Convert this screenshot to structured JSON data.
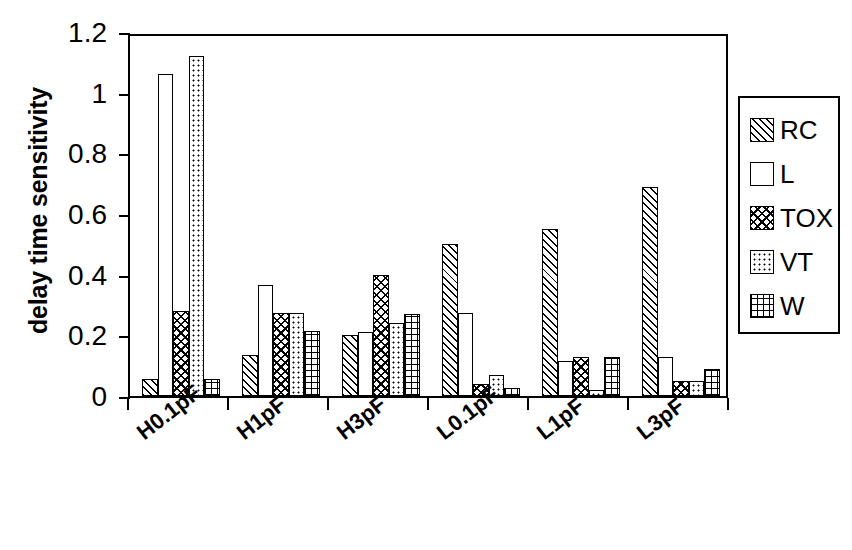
{
  "chart_data": {
    "type": "bar",
    "title": "",
    "subtitle": "",
    "xlabel": "",
    "ylabel": "delay time sensitivity",
    "categories": [
      "H0.1pF",
      "H1pF",
      "H3pF",
      "L0.1pF",
      "L1pF",
      "L3pF"
    ],
    "series": [
      {
        "name": "RC",
        "pattern": "diagonal-hatch",
        "values": [
          0.055,
          0.135,
          0.2,
          0.5,
          0.55,
          0.69
        ]
      },
      {
        "name": "L",
        "pattern": "empty",
        "values": [
          1.06,
          0.365,
          0.21,
          0.275,
          0.115,
          0.13
        ]
      },
      {
        "name": "TOX",
        "pattern": "diagonal-cross-hatch",
        "values": [
          0.28,
          0.275,
          0.4,
          0.04,
          0.13,
          0.05
        ]
      },
      {
        "name": "VT",
        "pattern": "dotted",
        "values": [
          1.12,
          0.275,
          0.24,
          0.07,
          0.02,
          0.05
        ]
      },
      {
        "name": "W",
        "pattern": "square-grid",
        "values": [
          0.055,
          0.215,
          0.27,
          0.025,
          0.13,
          0.09
        ]
      }
    ],
    "ylim": [
      0,
      1.2
    ],
    "y_ticks": [
      0,
      0.2,
      0.4,
      0.6,
      0.8,
      1,
      1.2
    ],
    "y_tick_labels": [
      "0",
      "0.2",
      "0.4",
      "0.6",
      "0.8",
      "1",
      "1.2"
    ],
    "grid": false,
    "legend_position": "right-outside",
    "legend_entries": [
      "RC",
      "L",
      "TOX",
      "VT",
      "W"
    ],
    "colors": {
      "bar_fill": "#ffffff",
      "bar_stroke": "#000000",
      "axis": "#000000",
      "background": "#ffffff"
    }
  }
}
